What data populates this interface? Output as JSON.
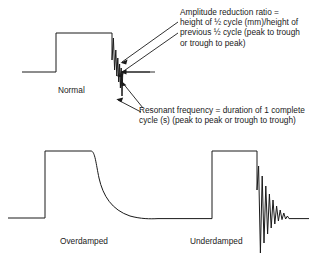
{
  "figure": {
    "name": "damping-waveform-diagram",
    "background_color": "#ffffff",
    "line_color": "#1a1a1a"
  },
  "waveforms": [
    {
      "id": "normal",
      "label": "Normal",
      "description": "square pulse followed by a brief damped oscillation"
    },
    {
      "id": "overdamped",
      "label": "Overdamped",
      "description": "square pulse with slow exponential return to baseline"
    },
    {
      "id": "underdamped",
      "label": "Underdamped",
      "description": "square pulse followed by decaying ringing oscillation"
    }
  ],
  "annotations": {
    "amplitude_reduction": {
      "name": "amplitude-reduction-ratio",
      "lines": [
        "Amplitude reduction ratio =",
        "height of ½ cycle (mm)/height of",
        "previous ½ cycle (peak to trough",
        "or trough to peak)"
      ]
    },
    "resonant_frequency": {
      "name": "resonant-frequency",
      "lines": [
        "Resonant frequency = duration of 1 complete",
        "cycle (s) (peak to peak or trough to trough)"
      ]
    }
  },
  "leaders": {
    "count": 4,
    "targets": [
      "first-peak-of-ringing",
      "second-peak-of-ringing",
      "trough-of-ringing",
      "lower-trough-of-ringing"
    ]
  }
}
